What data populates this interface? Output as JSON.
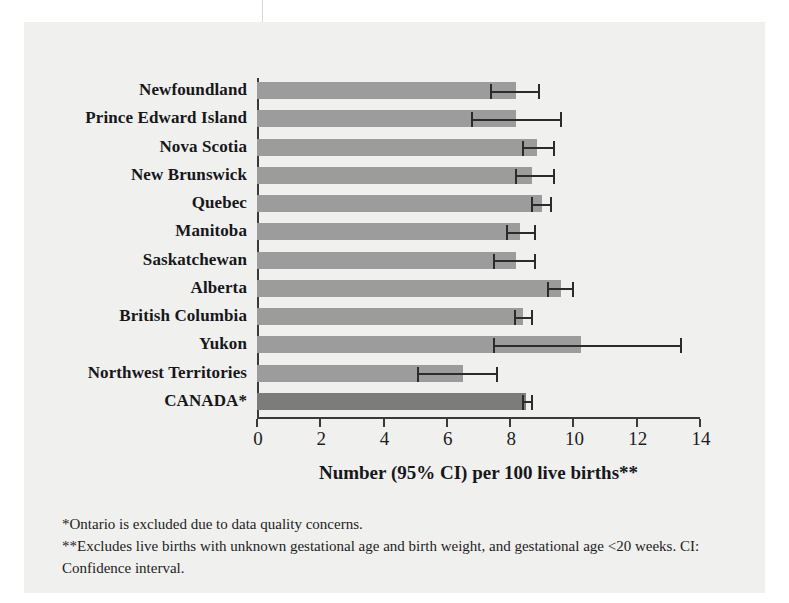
{
  "chart_data": {
    "type": "bar",
    "orientation": "horizontal",
    "title": "",
    "xlabel": "Number (95% CI) per 100 live births**",
    "ylabel": "",
    "xlim": [
      0,
      14
    ],
    "xticks": [
      0,
      2,
      4,
      6,
      8,
      10,
      12,
      14
    ],
    "grid": false,
    "legend": "none",
    "bar_color": "#9c9c9c",
    "total_bar_color": "#7c7c7c",
    "error_bar_color": "#2b2b2b",
    "categories": [
      "Newfoundland",
      "Prince Edward Island",
      "Nova Scotia",
      "New Brunswick",
      "Quebec",
      "Manitoba",
      "Saskatchewan",
      "Alberta",
      "British Columbia",
      "Yukon",
      "Northwest Territories",
      "CANADA*"
    ],
    "values": [
      8.2,
      8.2,
      8.85,
      8.7,
      9.0,
      8.3,
      8.2,
      9.6,
      8.4,
      10.25,
      6.5,
      8.5
    ],
    "ci_lower": [
      7.4,
      6.8,
      8.4,
      8.2,
      8.7,
      7.9,
      7.5,
      9.2,
      8.15,
      7.5,
      5.1,
      8.4
    ],
    "ci_upper": [
      8.9,
      9.6,
      9.4,
      9.4,
      9.3,
      8.8,
      8.8,
      10.0,
      8.7,
      13.4,
      7.6,
      8.7
    ],
    "is_total": [
      false,
      false,
      false,
      false,
      false,
      false,
      false,
      false,
      false,
      false,
      false,
      true
    ]
  },
  "notes": [
    "*Ontario is excluded due to data quality concerns.",
    "**Excludes live births with unknown gestational age and birth weight, and gestational age <20 weeks. CI: Confidence interval."
  ]
}
